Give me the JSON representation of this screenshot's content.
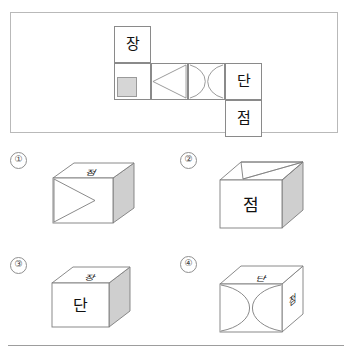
{
  "question": {
    "type": "cube-net-folding",
    "net_panel": {
      "cells": [
        {
          "id": "top-left",
          "row": 0,
          "col": 0,
          "content": "장",
          "kind": "text"
        },
        {
          "id": "mid-1",
          "row": 1,
          "col": 0,
          "content": "",
          "kind": "gray-square"
        },
        {
          "id": "mid-2",
          "row": 1,
          "col": 1,
          "content": "",
          "kind": "triangle-left"
        },
        {
          "id": "mid-3",
          "row": 1,
          "col": 2,
          "content": "",
          "kind": "double-arc-lens"
        },
        {
          "id": "mid-4",
          "row": 1,
          "col": 3,
          "content": "단",
          "kind": "text"
        },
        {
          "id": "bot-4",
          "row": 2,
          "col": 3,
          "content": "점",
          "kind": "text"
        }
      ]
    },
    "options": [
      {
        "number": "①",
        "faces": {
          "top": "점",
          "front": "triangle-right",
          "right": "gray"
        },
        "top_text": "점",
        "front_text": "",
        "right_text": ""
      },
      {
        "number": "②",
        "faces": {
          "top": "triangle",
          "front": "점",
          "right": "gray"
        },
        "top_text": "",
        "front_text": "점",
        "right_text": ""
      },
      {
        "number": "③",
        "faces": {
          "top": "장",
          "front": "단",
          "right": "gray"
        },
        "top_text": "장",
        "front_text": "단",
        "right_text": ""
      },
      {
        "number": "④",
        "faces": {
          "top": "단",
          "front": "double-arc-lens",
          "right": "점"
        },
        "top_text": "단",
        "front_text": "",
        "right_text": "점"
      }
    ]
  },
  "colors": {
    "frame_border": "#b9b9b9",
    "cell_border": "#8a8a8a",
    "gray_fill": "#d6d6d6",
    "gray_face": "#cfcfcf",
    "cube_stroke": "#7d7d7d",
    "text": "#111111",
    "rule": "#9d9d9d"
  }
}
